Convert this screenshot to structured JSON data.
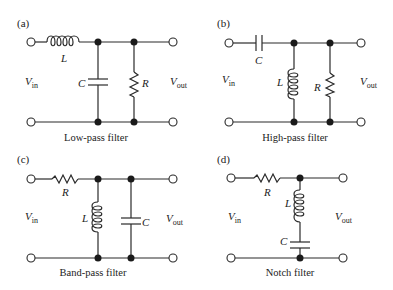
{
  "figure": {
    "panels": [
      {
        "id": "a",
        "tag": "(a)",
        "caption": "Low-pass filter",
        "series_element": "L",
        "shunt_elements": [
          "C",
          "R"
        ],
        "input_label": "V",
        "input_sub": "in",
        "output_label": "V",
        "output_sub": "out"
      },
      {
        "id": "b",
        "tag": "(b)",
        "caption": "High-pass filter",
        "series_element": "C",
        "shunt_elements": [
          "L",
          "R"
        ],
        "input_label": "V",
        "input_sub": "in",
        "output_label": "V",
        "output_sub": "out"
      },
      {
        "id": "c",
        "tag": "(c)",
        "caption": "Band-pass filter",
        "series_element": "R",
        "shunt_elements": [
          "L",
          "C"
        ],
        "input_label": "V",
        "input_sub": "in",
        "output_label": "V",
        "output_sub": "out"
      },
      {
        "id": "d",
        "tag": "(d)",
        "caption": "Notch filter",
        "series_element": "R",
        "shunt_elements": [
          "L+C series"
        ],
        "input_label": "V",
        "input_sub": "in",
        "output_label": "V",
        "output_sub": "out"
      }
    ]
  }
}
